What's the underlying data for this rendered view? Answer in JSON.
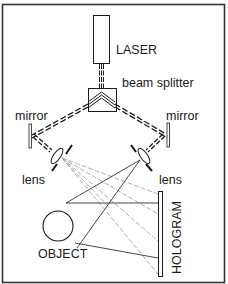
{
  "diagram": {
    "type": "holography-setup",
    "labels": {
      "laser": "LASER",
      "beam_splitter": "beam splitter",
      "mirror_left": "mirror",
      "mirror_right": "mirror",
      "lens_left": "lens",
      "lens_right": "lens",
      "object": "OBJECT",
      "hologram": "HOLOGRAM"
    },
    "components": [
      {
        "name": "laser",
        "label": "LASER"
      },
      {
        "name": "beam-splitter",
        "label": "beam splitter"
      },
      {
        "name": "mirror-left",
        "label": "mirror"
      },
      {
        "name": "mirror-right",
        "label": "mirror"
      },
      {
        "name": "lens-left",
        "label": "lens"
      },
      {
        "name": "lens-right",
        "label": "lens"
      },
      {
        "name": "object",
        "label": "OBJECT"
      },
      {
        "name": "hologram",
        "label": "HOLOGRAM"
      }
    ],
    "colors": {
      "line": "#1a1a1a",
      "light_ray": "#9a9a9a",
      "frame": "#333333",
      "background": "#ffffff"
    }
  }
}
